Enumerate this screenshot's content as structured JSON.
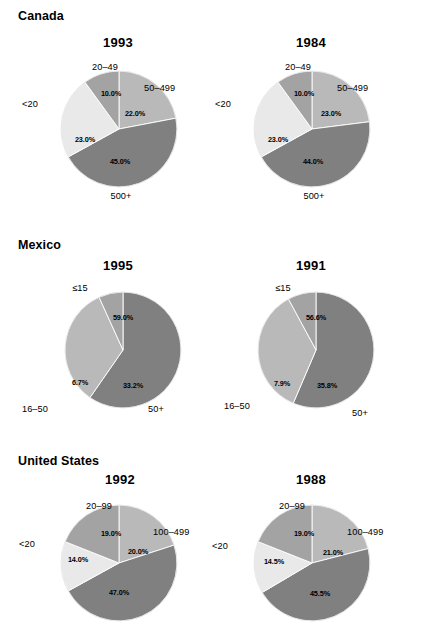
{
  "figure": {
    "background": "#ffffff",
    "width": 426,
    "height": 599
  },
  "palette": {
    "lightest": "#e9e9e9",
    "light": "#b9b9b9",
    "medium": "#a3a3a3",
    "dark": "#808080",
    "outline": "#ffffff",
    "text": "#000000"
  },
  "panels": [
    {
      "country": "Canada",
      "charts": [
        {
          "year": "1993",
          "slices": [
            {
              "label": "50–499",
              "value": "22.0%",
              "number": 22.0,
              "color": "#b9b9b9"
            },
            {
              "label": "500+",
              "value": "45.0%",
              "number": 45.0,
              "color": "#808080"
            },
            {
              "label": "<20",
              "value": "23.0%",
              "number": 23.0,
              "color": "#e9e9e9"
            },
            {
              "label": "20–49",
              "value": "10.0%",
              "number": 10.0,
              "color": "#a3a3a3"
            }
          ]
        },
        {
          "year": "1984",
          "slices": [
            {
              "label": "50–499",
              "value": "23.0%",
              "number": 23.0,
              "color": "#b9b9b9"
            },
            {
              "label": "500+",
              "value": "44.0%",
              "number": 44.0,
              "color": "#808080"
            },
            {
              "label": "<20",
              "value": "23.0%",
              "number": 23.0,
              "color": "#e9e9e9"
            },
            {
              "label": "20–49",
              "value": "10.0%",
              "number": 10.0,
              "color": "#a3a3a3"
            }
          ]
        }
      ]
    },
    {
      "country": "Mexico",
      "charts": [
        {
          "year": "1995",
          "slices": [
            {
              "label": "≤15",
              "value": "59.0%",
              "number": 59.0,
              "color": "#808080"
            },
            {
              "label": "50+",
              "value": "33.2%",
              "number": 33.2,
              "color": "#b9b9b9"
            },
            {
              "label": "16–50",
              "value": "6.7%",
              "number": 6.7,
              "color": "#a3a3a3"
            }
          ]
        },
        {
          "year": "1991",
          "slices": [
            {
              "label": "≤15",
              "value": "56.6%",
              "number": 56.6,
              "color": "#808080"
            },
            {
              "label": "50+",
              "value": "35.8%",
              "number": 35.8,
              "color": "#b9b9b9"
            },
            {
              "label": "16–50",
              "value": "7.9%",
              "number": 7.9,
              "color": "#a3a3a3"
            }
          ]
        }
      ]
    },
    {
      "country": "United States",
      "charts": [
        {
          "year": "1992",
          "slices": [
            {
              "label": "100–499",
              "value": "20.0%",
              "number": 20.0,
              "color": "#b9b9b9"
            },
            {
              "label": "500+",
              "value": "47.0%",
              "number": 47.0,
              "color": "#808080"
            },
            {
              "label": "<20",
              "value": "14.0%",
              "number": 14.0,
              "color": "#e9e9e9"
            },
            {
              "label": "20–99",
              "value": "19.0%",
              "number": 19.0,
              "color": "#a3a3a3"
            }
          ]
        },
        {
          "year": "1988",
          "slices": [
            {
              "label": "100–499",
              "value": "21.0%",
              "number": 21.0,
              "color": "#b9b9b9"
            },
            {
              "label": "500+",
              "value": "45.5%",
              "number": 45.5,
              "color": "#808080"
            },
            {
              "label": "<20",
              "value": "14.5%",
              "number": 14.5,
              "color": "#e9e9e9"
            },
            {
              "label": "20–99",
              "value": "19.0%",
              "number": 19.0,
              "color": "#a3a3a3"
            }
          ]
        }
      ]
    }
  ],
  "chart_data": [
    {
      "type": "pie",
      "title": "Canada 1993",
      "categories": [
        "50–499",
        "500+",
        "<20",
        "20–49"
      ],
      "values": [
        22.0,
        45.0,
        23.0,
        10.0
      ],
      "value_labels": [
        "22.0%",
        "45.0%",
        "23.0%",
        "10.0%"
      ],
      "start_angle_deg": 0,
      "direction": "clockwise",
      "colors": [
        "#b9b9b9",
        "#808080",
        "#e9e9e9",
        "#a3a3a3"
      ],
      "legend": "outside-labels"
    },
    {
      "type": "pie",
      "title": "Canada 1984",
      "categories": [
        "50–499",
        "500+",
        "<20",
        "20–49"
      ],
      "values": [
        23.0,
        44.0,
        23.0,
        10.0
      ],
      "value_labels": [
        "23.0%",
        "44.0%",
        "23.0%",
        "10.0%"
      ],
      "start_angle_deg": 0,
      "direction": "clockwise",
      "colors": [
        "#b9b9b9",
        "#808080",
        "#e9e9e9",
        "#a3a3a3"
      ],
      "legend": "outside-labels"
    },
    {
      "type": "pie",
      "title": "Mexico 1995",
      "categories": [
        "≤15",
        "50+",
        "16–50"
      ],
      "values": [
        59.0,
        33.2,
        6.7
      ],
      "value_labels": [
        "59.0%",
        "33.2%",
        "6.7%"
      ],
      "start_angle_deg": 0,
      "direction": "clockwise",
      "colors": [
        "#808080",
        "#b9b9b9",
        "#a3a3a3"
      ],
      "legend": "outside-labels"
    },
    {
      "type": "pie",
      "title": "Mexico 1991",
      "categories": [
        "≤15",
        "50+",
        "16–50"
      ],
      "values": [
        56.6,
        35.8,
        7.9
      ],
      "value_labels": [
        "56.6%",
        "35.8%",
        "7.9%"
      ],
      "start_angle_deg": 0,
      "direction": "clockwise",
      "colors": [
        "#808080",
        "#b9b9b9",
        "#a3a3a3"
      ],
      "legend": "outside-labels"
    },
    {
      "type": "pie",
      "title": "United States 1992",
      "categories": [
        "100–499",
        "500+",
        "<20",
        "20–99"
      ],
      "values": [
        20.0,
        47.0,
        14.0,
        19.0
      ],
      "value_labels": [
        "20.0%",
        "47.0%",
        "14.0%",
        "19.0%"
      ],
      "start_angle_deg": 0,
      "direction": "clockwise",
      "colors": [
        "#b9b9b9",
        "#808080",
        "#e9e9e9",
        "#a3a3a3"
      ],
      "legend": "outside-labels"
    },
    {
      "type": "pie",
      "title": "United States 1988",
      "categories": [
        "100–499",
        "500+",
        "<20",
        "20–99"
      ],
      "values": [
        21.0,
        45.5,
        14.5,
        19.0
      ],
      "value_labels": [
        "21.0%",
        "45.5%",
        "14.5%",
        "19.0%"
      ],
      "start_angle_deg": 0,
      "direction": "clockwise",
      "colors": [
        "#b9b9b9",
        "#808080",
        "#e9e9e9",
        "#a3a3a3"
      ],
      "legend": "outside-labels"
    }
  ]
}
